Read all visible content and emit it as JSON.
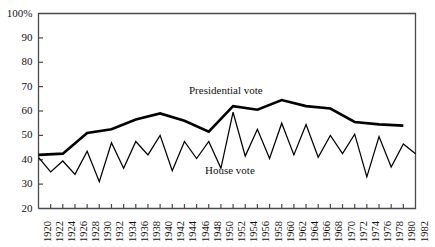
{
  "chart_data": {
    "type": "line",
    "title": "",
    "subtitle": "",
    "xlabel": "",
    "ylabel": "",
    "xlim": [
      1920,
      1982
    ],
    "ylim": [
      20,
      100
    ],
    "yticks": [
      20,
      30,
      40,
      50,
      60,
      70,
      80,
      90,
      100
    ],
    "ytick_labels": [
      "20",
      "30",
      "40",
      "50",
      "60",
      "70",
      "80",
      "90",
      "100%"
    ],
    "xticks": [
      1920,
      1922,
      1924,
      1926,
      1928,
      1930,
      1932,
      1934,
      1936,
      1938,
      1940,
      1942,
      1944,
      1946,
      1948,
      1950,
      1952,
      1954,
      1956,
      1958,
      1960,
      1962,
      1964,
      1966,
      1968,
      1970,
      1972,
      1974,
      1976,
      1978,
      1980,
      1982
    ],
    "xtick_labels": [
      "1920",
      "1922",
      "1924",
      "1926",
      "1928",
      "1930",
      "1932",
      "1934",
      "1936",
      "1938",
      "1940",
      "1942",
      "1944",
      "1946",
      "1948",
      "1950",
      "1952",
      "1954",
      "1956",
      "1958",
      "1960",
      "1962",
      "1964",
      "1966",
      "1968",
      "1970",
      "1972",
      "1974",
      "1976",
      "1978",
      "1980",
      "1982"
    ],
    "grid": false,
    "legend_position": "inline-annotation",
    "series": [
      {
        "name": "Presidential vote",
        "line_weight": "thick",
        "color": "#000000",
        "x": [
          1920,
          1924,
          1928,
          1932,
          1936,
          1940,
          1944,
          1948,
          1952,
          1956,
          1960,
          1964,
          1968,
          1972,
          1976,
          1980
        ],
        "values": [
          42,
          42.5,
          51,
          52.5,
          56.5,
          59,
          56,
          51.5,
          62,
          60.5,
          64.5,
          62,
          61,
          55.5,
          54.5,
          54
        ]
      },
      {
        "name": "House vote",
        "line_weight": "thin",
        "color": "#000000",
        "x": [
          1920,
          1922,
          1924,
          1926,
          1928,
          1930,
          1932,
          1934,
          1936,
          1938,
          1940,
          1942,
          1944,
          1946,
          1948,
          1950,
          1952,
          1954,
          1956,
          1958,
          1960,
          1962,
          1964,
          1966,
          1968,
          1970,
          1972,
          1974,
          1976,
          1978,
          1980,
          1982
        ],
        "values": [
          41,
          35,
          39.5,
          34,
          43.5,
          31,
          47,
          36.5,
          47.5,
          42,
          50,
          35.5,
          47.5,
          40.5,
          47.5,
          36.5,
          59.5,
          41.5,
          52.5,
          40.5,
          55,
          42,
          54.5,
          41,
          50,
          42.5,
          50.5,
          33,
          49.5,
          37,
          46.5,
          42.5
        ]
      }
    ],
    "annotations": [
      {
        "text": "Presidential vote",
        "x_px": 189,
        "y_px": 84
      },
      {
        "text": "House vote",
        "x_px": 205,
        "y_px": 164
      }
    ]
  }
}
